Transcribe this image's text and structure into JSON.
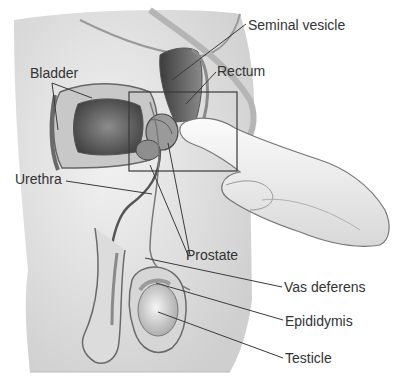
{
  "diagram": {
    "style": "grayscale medical illustration",
    "colors": {
      "background": "#ffffff",
      "body_fill": "#e6e6e6",
      "tissue_dark": "#6e6e6e",
      "outline": "#555555",
      "label_text": "#333333",
      "leader_line": "#3a3a3a"
    },
    "labels": {
      "seminal_vesicle": "Seminal vesicle",
      "rectum": "Rectum",
      "bladder": "Bladder",
      "urethra": "Urethra",
      "prostate": "Prostate",
      "vas_deferens": "Vas deferens",
      "epididymis": "Epididymis",
      "testicle": "Testicle"
    },
    "highlight_box": {
      "x": 129,
      "y": 92,
      "width": 108,
      "height": 79
    }
  }
}
